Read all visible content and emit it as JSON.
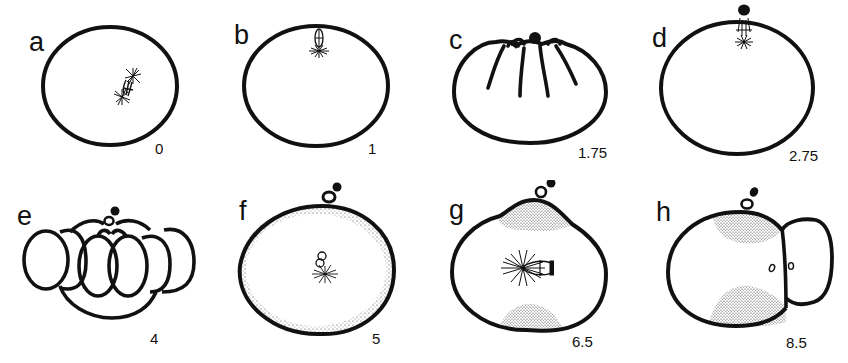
{
  "figure": {
    "panels": [
      {
        "letter": "a",
        "time": "0",
        "stage": "meiotic spindle in cytoplasm"
      },
      {
        "letter": "b",
        "time": "1",
        "stage": "spindle migrated to cortex"
      },
      {
        "letter": "c",
        "time": "1.75",
        "stage": "cortical furrows / contraction"
      },
      {
        "letter": "d",
        "time": "2.75",
        "stage": "first polar body with second spindle"
      },
      {
        "letter": "e",
        "time": "4",
        "stage": "lobed / contracted egg with polar bodies"
      },
      {
        "letter": "f",
        "time": "5",
        "stage": "pronuclei with aster, peripheral stippling"
      },
      {
        "letter": "g",
        "time": "6.5",
        "stage": "mitotic spindle, polar cytoplasm stippled"
      },
      {
        "letter": "h",
        "time": "8.5",
        "stage": "first cleavage, two cells"
      }
    ]
  },
  "colors": {
    "ink": "#111111",
    "stipple": "#555555",
    "background": "#ffffff"
  }
}
